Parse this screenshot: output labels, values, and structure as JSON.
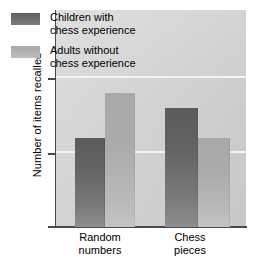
{
  "chart_data": {
    "type": "bar",
    "title": "",
    "xlabel": "",
    "ylabel": "Number of items recalled",
    "categories": [
      "Random numbers",
      "Chess pieces"
    ],
    "category_lines": [
      [
        "Random",
        "numbers"
      ],
      [
        "Chess",
        "pieces"
      ]
    ],
    "series": [
      {
        "name": "Children with chess experience",
        "name_lines": [
          "Children with",
          "chess experience"
        ],
        "color": "#6b6b6b",
        "values": [
          6,
          8
        ]
      },
      {
        "name": "Adults without chess experience",
        "name_lines": [
          "Adults without",
          "chess experience"
        ],
        "color": "#b2b2b2",
        "values": [
          9,
          6
        ]
      }
    ],
    "ylim": [
      0,
      14.6
    ],
    "yticks": [
      0,
      5,
      10
    ],
    "ytick_labels": [
      "0",
      "5",
      "10"
    ],
    "grid": true,
    "gridlines_at": [
      5,
      10
    ],
    "gridline_color": "#f3f3f3",
    "legend_position": "top-left-inside",
    "plot_background": "#d6d6d6"
  },
  "axis": {
    "y_title": "Number of items recalled",
    "tick_0": "0",
    "tick_5": "5",
    "tick_10": "10"
  },
  "legend": {
    "items": [
      {
        "line1": "Children with",
        "line2": "chess experience"
      },
      {
        "line1": "Adults without",
        "line2": "chess experience"
      }
    ]
  },
  "categories": [
    {
      "line1": "Random",
      "line2": "numbers"
    },
    {
      "line1": "Chess",
      "line2": "pieces"
    }
  ]
}
